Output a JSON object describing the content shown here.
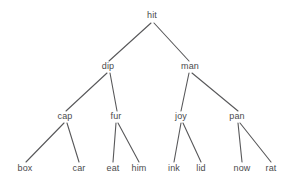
{
  "figure": {
    "type": "binary-tree-diagram",
    "background_color": "#ffffff",
    "edge_color": "#58585a",
    "text_color": "#4a4a4c",
    "width": 302,
    "height": 182
  },
  "tree": {
    "levels": [
      {
        "name": "root-level",
        "nodes": [
          {
            "id": "hit",
            "label": "hit",
            "x": 152,
            "y": 18
          }
        ]
      },
      {
        "name": "level-2",
        "nodes": [
          {
            "id": "dip",
            "label": "dip",
            "x": 108,
            "y": 69
          },
          {
            "id": "man",
            "label": "man",
            "x": 190,
            "y": 69
          }
        ]
      },
      {
        "name": "level-3",
        "nodes": [
          {
            "id": "cap",
            "label": "cap",
            "x": 65,
            "y": 119
          },
          {
            "id": "fur",
            "label": "fur",
            "x": 116,
            "y": 119
          },
          {
            "id": "joy",
            "label": "joy",
            "x": 181,
            "y": 119
          },
          {
            "id": "pan",
            "label": "pan",
            "x": 237,
            "y": 119
          }
        ]
      },
      {
        "name": "leaf-level",
        "nodes": [
          {
            "id": "box",
            "label": "box",
            "x": 25,
            "y": 171
          },
          {
            "id": "car",
            "label": "car",
            "x": 79,
            "y": 171
          },
          {
            "id": "eat",
            "label": "eat",
            "x": 113,
            "y": 171
          },
          {
            "id": "him",
            "label": "him",
            "x": 139,
            "y": 171
          },
          {
            "id": "ink",
            "label": "ink",
            "x": 174,
            "y": 171
          },
          {
            "id": "lid",
            "label": "lid",
            "x": 201,
            "y": 171
          },
          {
            "id": "now",
            "label": "now",
            "x": 242,
            "y": 171
          },
          {
            "id": "rat",
            "label": "rat",
            "x": 271,
            "y": 171
          }
        ]
      }
    ],
    "edges": [
      {
        "id": "hit-dip",
        "from": "hit",
        "to": "dip",
        "x1": 151,
        "y1": 23,
        "x2": 109,
        "y2": 61
      },
      {
        "id": "hit-man",
        "from": "hit",
        "to": "man",
        "x1": 154,
        "y1": 23,
        "x2": 189,
        "y2": 61
      },
      {
        "id": "dip-cap",
        "from": "dip",
        "to": "cap",
        "x1": 107,
        "y1": 73,
        "x2": 66,
        "y2": 111
      },
      {
        "id": "dip-fur",
        "from": "dip",
        "to": "fur",
        "x1": 110,
        "y1": 73,
        "x2": 117,
        "y2": 111
      },
      {
        "id": "man-joy",
        "from": "man",
        "to": "joy",
        "x1": 189,
        "y1": 73,
        "x2": 181,
        "y2": 111
      },
      {
        "id": "man-pan",
        "from": "man",
        "to": "pan",
        "x1": 192,
        "y1": 73,
        "x2": 238,
        "y2": 111
      },
      {
        "id": "cap-box",
        "from": "cap",
        "to": "box",
        "x1": 64,
        "y1": 123,
        "x2": 26,
        "y2": 162
      },
      {
        "id": "cap-car",
        "from": "cap",
        "to": "car",
        "x1": 67,
        "y1": 123,
        "x2": 79,
        "y2": 162
      },
      {
        "id": "fur-eat",
        "from": "fur",
        "to": "eat",
        "x1": 116,
        "y1": 123,
        "x2": 113,
        "y2": 162
      },
      {
        "id": "fur-him",
        "from": "fur",
        "to": "him",
        "x1": 118,
        "y1": 123,
        "x2": 139,
        "y2": 162
      },
      {
        "id": "joy-ink",
        "from": "joy",
        "to": "ink",
        "x1": 181,
        "y1": 123,
        "x2": 174,
        "y2": 162
      },
      {
        "id": "joy-lid",
        "from": "joy",
        "to": "lid",
        "x1": 183,
        "y1": 123,
        "x2": 201,
        "y2": 162
      },
      {
        "id": "pan-now",
        "from": "pan",
        "to": "now",
        "x1": 238,
        "y1": 123,
        "x2": 242,
        "y2": 162
      },
      {
        "id": "pan-rat",
        "from": "pan",
        "to": "rat",
        "x1": 240,
        "y1": 123,
        "x2": 271,
        "y2": 162
      }
    ]
  }
}
